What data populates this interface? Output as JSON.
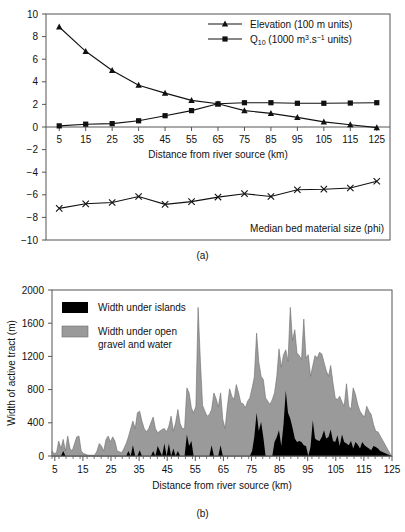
{
  "figure": {
    "panel_a_caption": "(a)",
    "panel_b_caption": "(b)",
    "xlabel": "Distance from river source (km)"
  },
  "colors": {
    "line": "#111111",
    "axis": "#555555",
    "gravel_fill": "#9a9a9a",
    "island_fill": "#000000",
    "background": "#ffffff"
  },
  "chart_data": [
    {
      "type": "line",
      "panel": "(a)",
      "title": "",
      "xlabel": "Distance from river source (km)",
      "ylabel": "",
      "xlim": [
        0,
        130
      ],
      "ylim": [
        -10,
        10
      ],
      "ytick_step": 2,
      "grid": false,
      "legend_position": "top-right",
      "annotation": "Median bed material size (phi)",
      "xticks": [
        5,
        15,
        25,
        35,
        45,
        55,
        65,
        75,
        85,
        95,
        105,
        115,
        125
      ],
      "yticks": [
        -10,
        -8,
        -6,
        -4,
        -2,
        0,
        2,
        4,
        6,
        8,
        10
      ],
      "x": [
        5,
        15,
        25,
        35,
        45,
        55,
        65,
        75,
        85,
        95,
        105,
        115,
        125
      ],
      "series": [
        {
          "name": "Elevation (100 m units)",
          "marker": "triangle",
          "values": [
            8.85,
            6.7,
            5.0,
            3.7,
            3.0,
            2.35,
            2.05,
            1.45,
            1.2,
            0.85,
            0.45,
            0.2,
            -0.05
          ]
        },
        {
          "name": "Q10 (1000 m3.s-1 units)",
          "marker": "square",
          "values": [
            0.1,
            0.25,
            0.3,
            0.55,
            1.0,
            1.45,
            2.05,
            2.15,
            2.15,
            2.1,
            2.1,
            2.12,
            2.15
          ]
        },
        {
          "name": "Median bed material size (phi)",
          "marker": "cross",
          "values": [
            -7.2,
            -6.8,
            -6.68,
            -6.15,
            -6.85,
            -6.6,
            -6.2,
            -5.9,
            -6.15,
            -5.55,
            -5.5,
            -5.4,
            -4.8
          ]
        }
      ],
      "legend": [
        {
          "label": "Elevation (100 m units)",
          "marker": "triangle"
        },
        {
          "label": "Q10 (1000 m3.s-1 units)",
          "marker": "square"
        }
      ]
    },
    {
      "type": "area",
      "panel": "(b)",
      "title": "",
      "xlabel": "Distance from river source (km)",
      "ylabel": "Width of active tract (m)",
      "xlim": [
        4,
        125
      ],
      "ylim": [
        0,
        2000
      ],
      "ytick_step": 400,
      "grid": false,
      "legend_position": "top-left",
      "xticks": [
        5,
        15,
        25,
        35,
        45,
        55,
        65,
        75,
        85,
        95,
        105,
        115,
        125
      ],
      "minor_tick_step": 5,
      "yticks": [
        0,
        400,
        800,
        1200,
        1600,
        2000
      ],
      "legend": [
        {
          "label": "Width under islands",
          "swatch": "#000000"
        },
        {
          "label": "Width under open gravel and water",
          "swatch": "#9a9a9a"
        }
      ],
      "x": [
        4,
        4.8,
        5.6,
        6.4,
        7.2,
        8,
        8.8,
        9.6,
        10.4,
        11.2,
        12,
        12.8,
        13.6,
        14.4,
        15.2,
        16,
        16.8,
        17.6,
        18.4,
        19.2,
        20,
        20.8,
        21.6,
        22.4,
        23.2,
        24,
        24.8,
        25.6,
        26.4,
        27.2,
        28,
        28.8,
        29.6,
        30.4,
        31.2,
        32,
        32.8,
        33.6,
        34.4,
        35.2,
        36,
        36.8,
        37.6,
        38.4,
        39.2,
        40,
        40.8,
        41.6,
        42.4,
        43.2,
        44,
        44.8,
        45.6,
        46.4,
        47.2,
        48,
        48.8,
        49.6,
        50.4,
        51.2,
        52,
        52.8,
        53.6,
        54.4,
        55.2,
        56,
        56.8,
        57.6,
        58.4,
        59.2,
        60,
        60.8,
        61.6,
        62.4,
        63.2,
        64,
        64.8,
        65.6,
        66.4,
        67.2,
        68,
        68.8,
        69.6,
        70.4,
        71.2,
        72,
        72.8,
        73.6,
        74.4,
        75.2,
        76,
        76.8,
        77.6,
        78.4,
        79.2,
        80,
        80.8,
        81.6,
        82.4,
        83.2,
        84,
        84.8,
        85.6,
        86.4,
        87.2,
        88,
        88.8,
        89.6,
        90.4,
        91.2,
        92,
        92.8,
        93.6,
        94.4,
        95.2,
        96,
        96.8,
        97.6,
        98.4,
        99.2,
        100,
        100.8,
        101.6,
        102.4,
        103.2,
        104,
        104.8,
        105.6,
        106.4,
        107.2,
        108,
        108.8,
        109.6,
        110.4,
        111.2,
        112,
        112.8,
        113.6,
        114.4,
        115.2,
        116,
        116.8,
        117.6,
        118.4,
        119.2,
        120,
        120.8,
        121.6,
        122.4,
        123.2,
        124,
        124.8
      ],
      "total_width": [
        60,
        30,
        40,
        180,
        90,
        200,
        60,
        240,
        90,
        60,
        150,
        230,
        240,
        60,
        30,
        20,
        10,
        10,
        10,
        10,
        60,
        150,
        120,
        60,
        200,
        240,
        170,
        230,
        180,
        60,
        50,
        40,
        90,
        150,
        230,
        330,
        420,
        330,
        520,
        540,
        420,
        330,
        290,
        330,
        400,
        470,
        330,
        280,
        300,
        320,
        330,
        290,
        360,
        480,
        300,
        400,
        560,
        390,
        330,
        330,
        820,
        760,
        580,
        520,
        600,
        1790,
        1140,
        610,
        540,
        480,
        500,
        560,
        760,
        690,
        590,
        760,
        440,
        330,
        590,
        810,
        720,
        680,
        860,
        760,
        640,
        630,
        580,
        660,
        700,
        820,
        950,
        1480,
        1130,
        960,
        920,
        700,
        660,
        620,
        680,
        760,
        960,
        1290,
        1070,
        1220,
        1280,
        1140,
        1790,
        1390,
        1520,
        1240,
        1210,
        1160,
        1650,
        1180,
        1220,
        960,
        1090,
        1210,
        1180,
        1250,
        1230,
        1130,
        1030,
        960,
        1090,
        880,
        700,
        680,
        720,
        650,
        600,
        870,
        600,
        560,
        820,
        740,
        620,
        540,
        500,
        470,
        600,
        540,
        500,
        380,
        300,
        290
      ],
      "island_width": [
        0,
        0,
        0,
        0,
        0,
        60,
        0,
        0,
        0,
        0,
        0,
        0,
        0,
        0,
        0,
        0,
        0,
        0,
        0,
        0,
        0,
        0,
        0,
        0,
        0,
        0,
        0,
        0,
        0,
        0,
        0,
        0,
        0,
        0,
        60,
        0,
        130,
        0,
        0,
        70,
        0,
        0,
        0,
        0,
        0,
        60,
        0,
        120,
        60,
        0,
        150,
        0,
        150,
        0,
        90,
        0,
        60,
        0,
        0,
        0,
        260,
        120,
        180,
        0,
        0,
        0,
        0,
        0,
        0,
        0,
        0,
        130,
        0,
        0,
        0,
        130,
        0,
        0,
        0,
        0,
        0,
        0,
        0,
        0,
        0,
        0,
        0,
        0,
        0,
        60,
        230,
        520,
        300,
        410,
        230,
        0,
        0,
        0,
        0,
        170,
        230,
        310,
        120,
        380,
        790,
        520,
        450,
        340,
        210,
        170,
        180,
        170,
        130,
        120,
        0,
        110,
        430,
        210,
        190,
        180,
        230,
        310,
        210,
        230,
        320,
        180,
        170,
        250,
        120,
        260,
        170,
        150,
        130,
        180,
        90,
        170,
        140,
        90,
        170,
        130,
        110,
        90,
        70,
        120,
        110,
        90,
        60
      ]
    }
  ]
}
